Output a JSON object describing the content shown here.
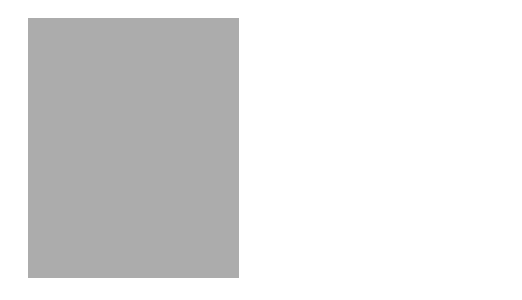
{
  "map": {
    "title": "",
    "colors": {
      "background": "#ffffff",
      "ocean_panel": "#a9a9a9",
      "mexico_canada": "#b5b5b5",
      "coastal_shelf": "#7a7a7a",
      "lakes": "#ffffff",
      "district_light": "#c4c4c4",
      "district_mid": "#b8b8b8",
      "district_dark": "#8e8e8e",
      "district_border": "#ffffff"
    },
    "districts": [
      {
        "number": "1",
        "city": "Boston",
        "shade": "light"
      },
      {
        "number": "2",
        "city": "New York",
        "shade": "dark"
      },
      {
        "number": "3",
        "city": "Philadelphia",
        "shade": "mid"
      },
      {
        "number": "4",
        "city": "Cleveland",
        "shade": "light"
      },
      {
        "number": "5",
        "city": "Richmond",
        "shade": "light"
      },
      {
        "number": "6",
        "city": "Atlanta",
        "shade": "light"
      },
      {
        "number": "7",
        "city": "Chicago",
        "shade": "light"
      },
      {
        "number": "8",
        "city": "St. Louis",
        "shade": "dark"
      },
      {
        "number": "9",
        "city": "Minneapolis",
        "shade": "light"
      },
      {
        "number": "10",
        "city": "Kansas City",
        "shade": "light"
      },
      {
        "number": "11",
        "city": "Dallas",
        "shade": "light"
      },
      {
        "number": "12",
        "city": "San Francisco",
        "shade": "dark"
      }
    ]
  }
}
